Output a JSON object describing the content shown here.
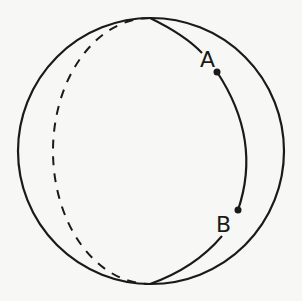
{
  "diagram": {
    "points": [
      {
        "label": "A",
        "x": 217,
        "y": 72,
        "label_x": 200,
        "label_y": 67
      },
      {
        "label": "B",
        "x": 238,
        "y": 210,
        "label_x": 216,
        "label_y": 232
      }
    ],
    "sphere": {
      "cx": 151,
      "cy": 151,
      "r": 133
    },
    "front_meridian": {
      "rx": 99,
      "side": "right",
      "style": "solid"
    },
    "back_meridian": {
      "rx": 97,
      "side": "left",
      "style": "dashed"
    },
    "colors": {
      "stroke": "#1a1a1a",
      "background": "#f7f7f5"
    }
  }
}
